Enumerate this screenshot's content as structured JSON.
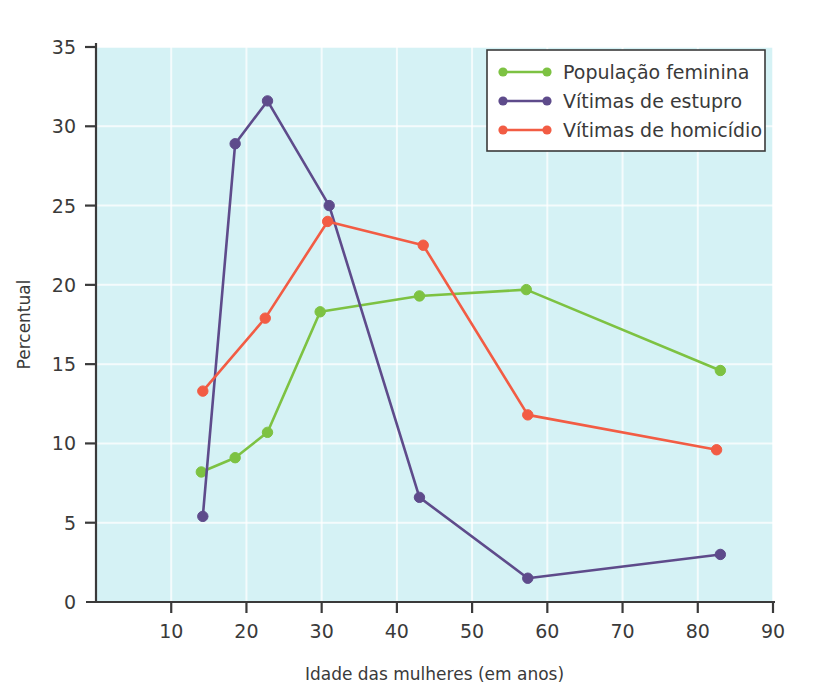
{
  "chart_data": {
    "type": "line",
    "title": "",
    "xlabel": "Idade das mulheres (em anos)",
    "ylabel": "Percentual",
    "xlim": [
      0,
      90
    ],
    "ylim": [
      0,
      35
    ],
    "xticks": [
      10,
      20,
      30,
      40,
      50,
      60,
      70,
      80,
      90
    ],
    "yticks": [
      0,
      5,
      10,
      15,
      20,
      25,
      30,
      35
    ],
    "xtick_labels": [
      "10",
      "20",
      "30",
      "40",
      "50",
      "60",
      "70",
      "80",
      "90"
    ],
    "ytick_labels": [
      "0",
      "5",
      "10",
      "15",
      "20",
      "25",
      "30",
      "35"
    ],
    "grid": true,
    "legend_position": "top-right",
    "plot_background": "#d5f2f5",
    "series": [
      {
        "name": "População feminina",
        "color": "#7dc242",
        "x": [
          14,
          18.5,
          22.8,
          29.8,
          43,
          57.2,
          83
        ],
        "values": [
          8.2,
          9.1,
          10.7,
          18.3,
          19.3,
          19.7,
          14.6
        ]
      },
      {
        "name": "Vítimas de estupro",
        "color": "#5e4b8b",
        "x": [
          14.2,
          18.5,
          22.8,
          31,
          43,
          57.4,
          83
        ],
        "values": [
          5.4,
          28.9,
          31.6,
          25.0,
          6.6,
          1.5,
          3.0
        ]
      },
      {
        "name": "Vítimas de homicídio",
        "color": "#f25c44",
        "x": [
          14.2,
          22.5,
          30.8,
          43.5,
          57.4,
          82.5
        ],
        "values": [
          13.3,
          17.9,
          24.0,
          22.5,
          11.8,
          9.6
        ]
      }
    ]
  },
  "legend": {
    "items": [
      {
        "label": "População feminina",
        "color": "#7dc242"
      },
      {
        "label": "Vítimas de estupro",
        "color": "#5e4b8b"
      },
      {
        "label": "Vítimas de homicídio",
        "color": "#f25c44"
      }
    ]
  },
  "axes": {
    "x_title": "Idade das mulheres (em anos)",
    "y_title": "Percentual"
  }
}
